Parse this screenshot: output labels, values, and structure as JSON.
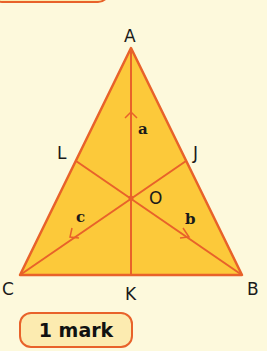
{
  "diagram": {
    "type": "triangle-medians",
    "colors": {
      "background": "#fdf9dc",
      "fill": "#fcc93a",
      "stroke": "#e8622a",
      "text": "#1a1a1a"
    },
    "vertices": {
      "A": {
        "label": "A",
        "x": 131,
        "y": 48
      },
      "B": {
        "label": "B",
        "x": 242,
        "y": 275
      },
      "C": {
        "label": "C",
        "x": 20,
        "y": 275
      }
    },
    "midpoints": {
      "K": {
        "label": "K"
      },
      "L": {
        "label": "L"
      },
      "J": {
        "label": "J"
      }
    },
    "centroid": {
      "label": "O"
    },
    "segment_labels": {
      "a": "a",
      "b": "b",
      "c": "c"
    }
  },
  "badge": {
    "label": "1 mark"
  }
}
